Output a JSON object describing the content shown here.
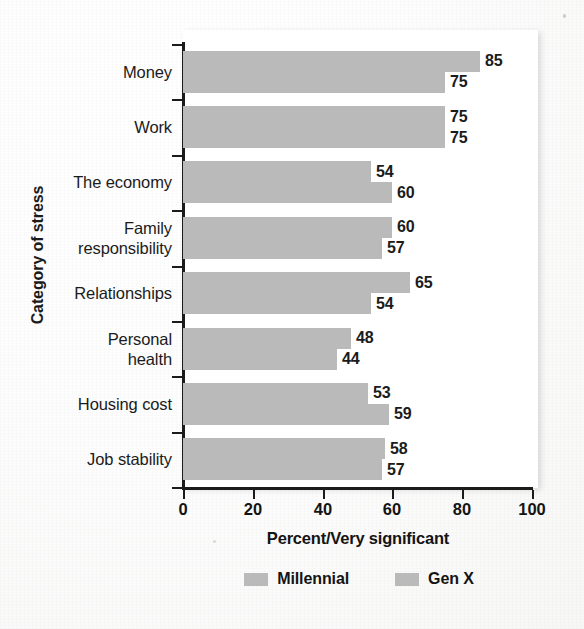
{
  "chart_data": {
    "type": "bar",
    "orientation": "horizontal",
    "title": "",
    "xlabel": "Percent/Very significant",
    "ylabel": "Category of stress",
    "xlim": [
      0,
      100
    ],
    "xticks": [
      0,
      20,
      40,
      60,
      80,
      100
    ],
    "grid": false,
    "legend_position": "bottom",
    "bar_color": "#bababa",
    "categories": [
      "Money",
      "Work",
      "The economy",
      "Family responsibility",
      "Relationships",
      "Personal health",
      "Housing cost",
      "Job stability"
    ],
    "series": [
      {
        "name": "Millennial",
        "values": [
          85,
          75,
          54,
          60,
          65,
          48,
          53,
          58
        ]
      },
      {
        "name": "Gen X",
        "values": [
          75,
          75,
          60,
          57,
          54,
          44,
          59,
          57
        ]
      }
    ]
  },
  "category_label_lines": [
    [
      "Money"
    ],
    [
      "Work"
    ],
    [
      "The economy"
    ],
    [
      "Family",
      "responsibility"
    ],
    [
      "Relationships"
    ],
    [
      "Personal",
      "health"
    ],
    [
      "Housing cost"
    ],
    [
      "Job stability"
    ]
  ],
  "axis": {
    "x_tick_labels": [
      "0",
      "20",
      "40",
      "60",
      "80",
      "100"
    ],
    "x_title": "Percent/Very significant",
    "y_title": "Category of stress"
  },
  "legend": {
    "entries": [
      {
        "label": "Millennial",
        "color": "#bababa"
      },
      {
        "label": "Gen X",
        "color": "#bababa"
      }
    ]
  }
}
